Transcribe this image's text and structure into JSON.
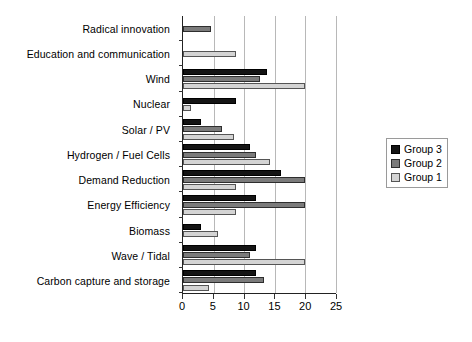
{
  "chart_data": {
    "type": "bar",
    "orientation": "horizontal",
    "title": "",
    "xlabel": "",
    "ylabel": "",
    "xlim": [
      0,
      25
    ],
    "xticks": [
      0,
      5,
      10,
      15,
      20,
      25
    ],
    "xtick_labels": [
      "0",
      "5",
      "10",
      "15",
      "20",
      "25"
    ],
    "grid": true,
    "grid_axis": "x",
    "legend_position": "right",
    "categories": [
      "Radical innovation",
      "Education  and communication",
      "Wind",
      "Nuclear",
      "Solar / PV",
      "Hydrogen / Fuel Cells",
      "Demand Reduction",
      "Energy Efficiency",
      "Biomass",
      "Wave / Tidal",
      "Carbon capture and storage"
    ],
    "series": [
      {
        "name": "Group 3",
        "color": "#141414",
        "values": [
          0,
          0,
          13.8,
          8.7,
          3.0,
          11.0,
          16.0,
          12.0,
          3.0,
          12.0,
          12.0
        ]
      },
      {
        "name": "Group 2",
        "color": "#7b7b7b",
        "values": [
          4.5,
          0,
          12.5,
          0,
          6.3,
          12.0,
          20.0,
          20.0,
          0,
          11.0,
          13.3
        ]
      },
      {
        "name": "Group 1",
        "color": "#d4d4d4",
        "values": [
          0,
          8.7,
          20.0,
          1.3,
          8.3,
          14.2,
          8.7,
          8.7,
          5.7,
          20.0,
          4.3
        ]
      }
    ]
  },
  "legend": {
    "items": [
      {
        "label": "Group 3",
        "key": "g3"
      },
      {
        "label": "Group 2",
        "key": "g2"
      },
      {
        "label": "Group 1",
        "key": "g1"
      }
    ]
  }
}
